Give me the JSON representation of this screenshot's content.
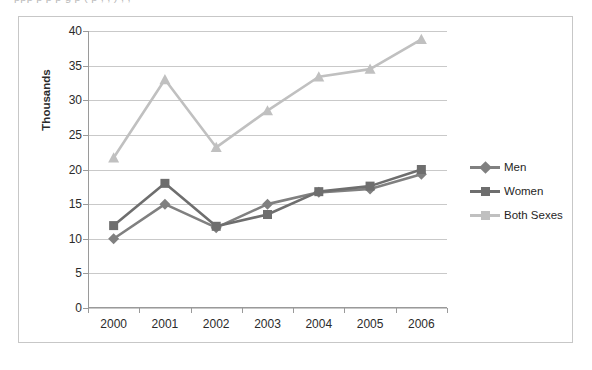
{
  "top_clipped_text": "ppp p p p    g   p  (        p  ,      ,    )    ,       ,",
  "chart_data": {
    "type": "line",
    "title": "",
    "xlabel": "",
    "ylabel": "Thousands",
    "categories": [
      "2000",
      "2001",
      "2002",
      "2003",
      "2004",
      "2005",
      "2006"
    ],
    "ylim": [
      0,
      40
    ],
    "ytick_step": 5,
    "yticks": [
      "0",
      "5",
      "10",
      "15",
      "20",
      "25",
      "30",
      "35",
      "40"
    ],
    "grid": "horizontal",
    "legend_position": "right",
    "series": [
      {
        "name": "Men",
        "marker": "diamond",
        "color": "#808080",
        "values": [
          10.0,
          15.0,
          11.6,
          15.0,
          16.7,
          17.2,
          19.3
        ]
      },
      {
        "name": "Women",
        "marker": "square",
        "color": "#6e6e6e",
        "values": [
          11.9,
          18.0,
          11.8,
          13.5,
          16.8,
          17.6,
          20.0
        ]
      },
      {
        "name": "Both Sexes",
        "marker": "triangle",
        "color": "#c0c0c0",
        "values": [
          21.7,
          33.0,
          23.2,
          28.5,
          33.4,
          34.5,
          38.8
        ]
      }
    ]
  },
  "colors": {
    "frame_border": "#c7c7c7",
    "gridline": "#c9c9c9",
    "axis": "#9a9a9a",
    "text": "#2b2b2b",
    "background": "#ffffff"
  }
}
